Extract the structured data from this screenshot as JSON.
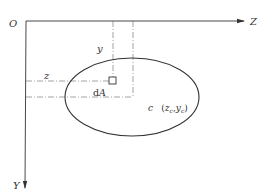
{
  "diagram": {
    "type": "area-moment-centroid",
    "labels": {
      "origin": "O",
      "z_axis": "Z",
      "y_axis": "Y",
      "dist_y": "y",
      "dist_z": "z",
      "element_d": "d",
      "element_A": "A",
      "centroid_c": "c",
      "centroid_open": "(",
      "centroid_zc": "z",
      "centroid_zc_sub": "c",
      "centroid_sep": ",",
      "centroid_yc": "y",
      "centroid_yc_sub": "c",
      "centroid_close": ")"
    },
    "colors": {
      "line": "#333333",
      "dash": "#555555",
      "background": "#ffffff"
    }
  }
}
